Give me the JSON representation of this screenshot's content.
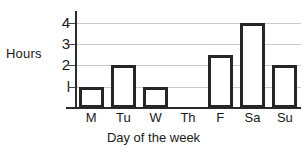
{
  "chart_data": {
    "type": "bar",
    "title": "",
    "xlabel": "Day of the week",
    "ylabel": "Hours",
    "categories": [
      "M",
      "Tu",
      "W",
      "Th",
      "F",
      "Sa",
      "Su"
    ],
    "values": [
      1,
      2,
      1,
      0,
      2.5,
      4,
      2
    ],
    "ylim": [
      0,
      4.5
    ],
    "yticks": [
      1,
      2,
      3,
      4
    ],
    "ytick_labels": [
      "l",
      "2",
      "3",
      "4"
    ],
    "grid": true,
    "legend": null,
    "colors": {
      "bar_fill": "#ffffff",
      "bar_edge": "#262626",
      "gridline": "#c9c9c9",
      "axis": "#2b2b2b",
      "text": "#1a1a1a",
      "background": "#ffffff"
    }
  }
}
